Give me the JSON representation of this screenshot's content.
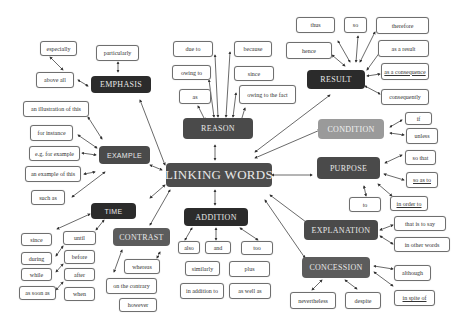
{
  "title": "LINKING WORDS",
  "colors": {
    "dark": "#2b2b2b",
    "mid": "#4a4a4a",
    "light": "#9a9a9a",
    "leaf_border": "#6f6f6f",
    "background": "#ffffff"
  },
  "categories": {
    "emphasis": {
      "label": "EMPHASIS",
      "items": [
        "especially",
        "particularly",
        "above all"
      ]
    },
    "reason": {
      "label": "REASON",
      "items": [
        "due to",
        "because",
        "owing to",
        "since",
        "as",
        "owing to the fact"
      ]
    },
    "result": {
      "label": "RESULT",
      "items": [
        "thus",
        "so",
        "therefore",
        "hence",
        "as a result",
        "as a consequence",
        "consequently"
      ]
    },
    "example": {
      "label": "EXAMPLE",
      "items": [
        "an illustration of this",
        "for instance",
        "e.g. for example",
        "an example of this",
        "such as"
      ]
    },
    "condition": {
      "label": "CONDITION",
      "items": [
        "if",
        "unless"
      ]
    },
    "purpose": {
      "label": "PURPOSE",
      "items": [
        "so that",
        "so as to",
        "in order to",
        "to"
      ]
    },
    "time": {
      "label": "TIME",
      "items": [
        "since",
        "until",
        "during",
        "before",
        "while",
        "after",
        "as soon as",
        "when"
      ]
    },
    "contrast": {
      "label": "CONTRAST",
      "items": [
        "whereas",
        "on the contrary",
        "however"
      ]
    },
    "addition": {
      "label": "ADDITION",
      "items": [
        "also",
        "and",
        "too",
        "similarly",
        "plus",
        "in addition to",
        "as well as"
      ]
    },
    "explanation": {
      "label": "EXPLANATION",
      "items": [
        "that is to say",
        "in other words"
      ]
    },
    "concession": {
      "label": "CONCESSION",
      "items": [
        "although",
        "in spite of",
        "nevertheless",
        "despite"
      ]
    }
  }
}
